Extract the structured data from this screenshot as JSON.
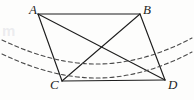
{
  "figure": {
    "kind": "geometry-diagram",
    "background_color": "#fdfdfc",
    "stroke_color": "#1d1d1d",
    "dashed_stroke_color": "#4a4a4a",
    "watermark_text": "m",
    "labels": [
      {
        "id": "A",
        "text": "A",
        "x": 29,
        "y": 3
      },
      {
        "id": "B",
        "text": "B",
        "x": 143,
        "y": 3
      },
      {
        "id": "C",
        "text": "C",
        "x": 50,
        "y": 78
      },
      {
        "id": "D",
        "text": "D",
        "x": 168,
        "y": 78
      }
    ],
    "vertices": [
      {
        "id": "A",
        "x": 38,
        "y": 14
      },
      {
        "id": "B",
        "x": 140,
        "y": 14
      },
      {
        "id": "C",
        "x": 62,
        "y": 81
      },
      {
        "id": "D",
        "x": 165,
        "y": 80
      }
    ],
    "edges": [
      {
        "id": "AB",
        "from": "A",
        "to": "B"
      },
      {
        "id": "BD",
        "from": "B",
        "to": "D"
      },
      {
        "id": "DC",
        "from": "D",
        "to": "C"
      },
      {
        "id": "CA",
        "from": "C",
        "to": "A"
      }
    ],
    "diagonals": [
      {
        "id": "AD",
        "from": "A",
        "to": "D"
      },
      {
        "id": "BC",
        "from": "B",
        "to": "C"
      }
    ],
    "intersection": {
      "id": "O",
      "x": 101,
      "y": 50
    },
    "dashed_curves": [
      {
        "id": "arc-upper",
        "path": "M 2 40 C 40 58, 70 64, 97 64 C 124 64, 156 57, 192 38",
        "dash": "4 3"
      },
      {
        "id": "arc-lower",
        "path": "M 2 54 C 40 72, 70 78, 97 78 C 124 78, 156 71, 192 52",
        "dash": "4 3"
      }
    ]
  }
}
